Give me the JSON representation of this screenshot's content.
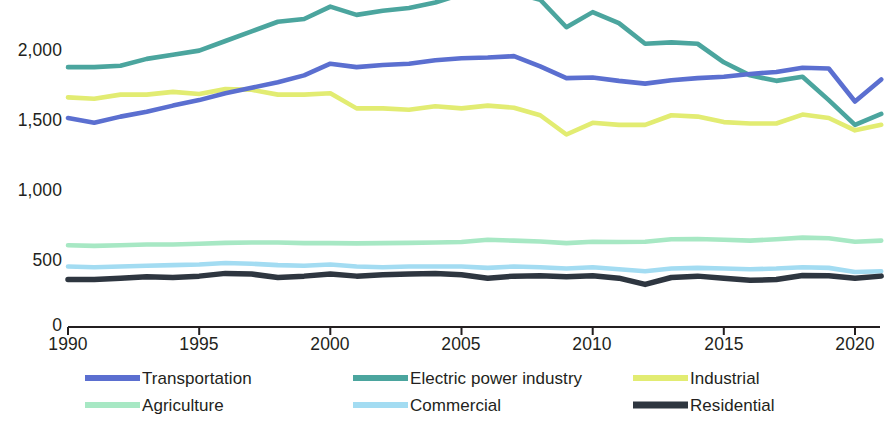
{
  "chart_data": {
    "type": "line",
    "title": "",
    "subtitle": "",
    "xlabel": "",
    "ylabel": "",
    "xlim": [
      1990,
      2021
    ],
    "ylim": [
      0,
      2400
    ],
    "grid": false,
    "legend_position": "bottom",
    "x_ticks": [
      "1990",
      "1995",
      "2000",
      "2005",
      "2010",
      "2015",
      "2020"
    ],
    "x_tick_values": [
      1990,
      1995,
      2000,
      2005,
      2010,
      2015,
      2020
    ],
    "y_ticks": [
      "0",
      "500",
      "1,000",
      "1,500",
      "2,000"
    ],
    "y_tick_values": [
      0,
      500,
      1000,
      1500,
      2000
    ],
    "x": [
      1990,
      1991,
      1992,
      1993,
      1994,
      1995,
      1996,
      1997,
      1998,
      1999,
      2000,
      2001,
      2002,
      2003,
      2004,
      2005,
      2006,
      2007,
      2008,
      2009,
      2010,
      2011,
      2012,
      2013,
      2014,
      2015,
      2016,
      2017,
      2018,
      2019,
      2020,
      2021
    ],
    "series": [
      {
        "name": "Transportation",
        "color": "#5b6fd0",
        "values": [
          1520,
          1485,
          1530,
          1565,
          1610,
          1650,
          1700,
          1740,
          1780,
          1830,
          1915,
          1890,
          1905,
          1915,
          1940,
          1955,
          1960,
          1970,
          1895,
          1810,
          1815,
          1790,
          1770,
          1795,
          1810,
          1820,
          1840,
          1855,
          1885,
          1880,
          1640,
          1800
        ]
      },
      {
        "name": "Electric power industry",
        "color": "#4ba59e",
        "values": [
          1890,
          1890,
          1900,
          1950,
          1980,
          2010,
          2080,
          2150,
          2220,
          2240,
          2330,
          2270,
          2300,
          2320,
          2360,
          2420,
          2435,
          2430,
          2380,
          2180,
          2290,
          2210,
          2060,
          2070,
          2060,
          1925,
          1830,
          1790,
          1820,
          1650,
          1470,
          1550
        ]
      },
      {
        "name": "Industrial",
        "color": "#e2ec72",
        "values": [
          1670,
          1660,
          1690,
          1690,
          1710,
          1695,
          1730,
          1725,
          1690,
          1690,
          1700,
          1590,
          1590,
          1580,
          1605,
          1590,
          1610,
          1595,
          1540,
          1400,
          1485,
          1470,
          1470,
          1540,
          1530,
          1490,
          1480,
          1480,
          1545,
          1520,
          1430,
          1470
        ]
      },
      {
        "name": "Agriculture",
        "color": "#a7e8c4",
        "values": [
          595,
          590,
          595,
          600,
          600,
          605,
          612,
          615,
          615,
          610,
          610,
          608,
          610,
          612,
          615,
          618,
          635,
          628,
          622,
          610,
          620,
          618,
          620,
          638,
          640,
          635,
          628,
          638,
          650,
          645,
          620,
          628
        ]
      },
      {
        "name": "Commercial",
        "color": "#a3dcf2",
        "values": [
          440,
          435,
          440,
          445,
          450,
          455,
          465,
          460,
          450,
          445,
          455,
          440,
          435,
          440,
          440,
          440,
          430,
          440,
          435,
          425,
          435,
          420,
          405,
          425,
          430,
          425,
          420,
          425,
          435,
          430,
          400,
          405
        ]
      },
      {
        "name": "Residential",
        "color": "#2e3640",
        "values": [
          345,
          345,
          355,
          365,
          360,
          370,
          390,
          385,
          360,
          370,
          385,
          370,
          380,
          385,
          390,
          380,
          355,
          370,
          372,
          365,
          372,
          355,
          310,
          360,
          370,
          355,
          340,
          345,
          375,
          372,
          355,
          370
        ]
      }
    ]
  },
  "legend": {
    "items": [
      {
        "label": "Transportation",
        "color": "#5b6fd0"
      },
      {
        "label": "Electric power industry",
        "color": "#4ba59e"
      },
      {
        "label": "Industrial",
        "color": "#e2ec72"
      },
      {
        "label": "Agriculture",
        "color": "#a7e8c4"
      },
      {
        "label": "Commercial",
        "color": "#a3dcf2"
      },
      {
        "label": "Residential",
        "color": "#2e3640"
      }
    ]
  },
  "axis": {
    "line_color": "#231f20"
  }
}
